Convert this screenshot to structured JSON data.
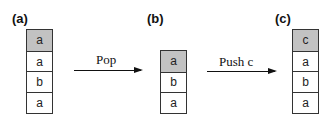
{
  "diagram": {
    "colors": {
      "top_cell": "#c2c2c2",
      "cell": "#ffffff",
      "border": "#333333",
      "arrow": "#111111"
    },
    "panels": [
      {
        "label": "(a)",
        "cells": [
          "a",
          "a",
          "b",
          "a"
        ],
        "top_index": 0
      },
      {
        "label": "(b)",
        "cells": [
          "a",
          "b",
          "a"
        ],
        "top_index": 0
      },
      {
        "label": "(c)",
        "cells": [
          "c",
          "a",
          "b",
          "a"
        ],
        "top_index": 0
      }
    ],
    "operations": [
      {
        "label": "Pop",
        "from": "(a)",
        "to": "(b)"
      },
      {
        "label": "Push c",
        "from": "(b)",
        "to": "(c)"
      }
    ]
  }
}
